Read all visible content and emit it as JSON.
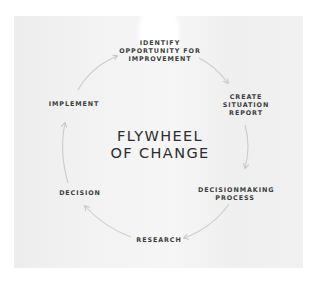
{
  "diagram": {
    "title_lines": [
      "FLYWHEEL",
      "OF CHANGE"
    ],
    "nodes": [
      {
        "id": "identify",
        "lines": [
          "IDENTIFY",
          "OPPORTUNITY FOR",
          "IMPROVEMENT"
        ]
      },
      {
        "id": "situation-report",
        "lines": [
          "CREATE",
          "SITUATION",
          "REPORT"
        ]
      },
      {
        "id": "decisionmaking",
        "lines": [
          "DECISIONMAKING",
          "PROCESS"
        ]
      },
      {
        "id": "research",
        "lines": [
          "RESEARCH"
        ]
      },
      {
        "id": "decision",
        "lines": [
          "DECISION"
        ]
      },
      {
        "id": "implement",
        "lines": [
          "IMPLEMENT"
        ]
      }
    ],
    "flow": [
      "identify",
      "situation-report",
      "decisionmaking",
      "research",
      "decision",
      "implement",
      "identify"
    ],
    "colors": {
      "panel": "#f2f2f2",
      "arrow": "#c4c4c4",
      "text": "#3e3e3e",
      "title": "#2d2d2d"
    }
  }
}
